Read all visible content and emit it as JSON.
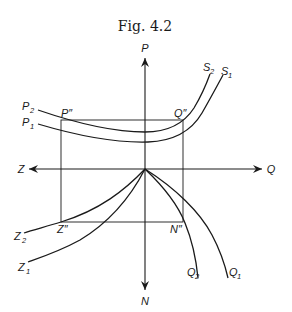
{
  "figure": {
    "title": "Fig.  4.2",
    "axes": {
      "up": "P",
      "down": "N",
      "left": "Z",
      "right": "Q"
    },
    "curves": {
      "p1": {
        "start": "P",
        "start_sub": "1",
        "end": "S",
        "end_sub": "1"
      },
      "p2": {
        "start": "P",
        "start_sub": "2",
        "end": "S",
        "end_sub": "2"
      },
      "z1": {
        "label": "Z",
        "sub": "1"
      },
      "z2": {
        "label": "Z",
        "sub": "2"
      },
      "q1": {
        "label": "Q",
        "sub": "1"
      },
      "q2": {
        "label": "Q",
        "sub": "2"
      }
    },
    "points": {
      "p_dd": "P″",
      "q_dd": "Q″",
      "z_dd": "Z″",
      "n_dd": "N″"
    },
    "colors": {
      "ink": "#1a1a1a",
      "background": "#ffffff"
    }
  }
}
